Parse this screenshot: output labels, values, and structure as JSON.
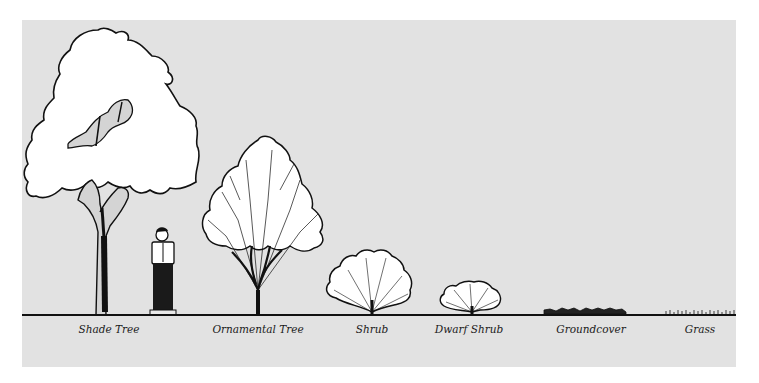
{
  "figure": {
    "background_color": "#e2e2e2",
    "line_color": "#111111",
    "canopy_fill": "#ffffff",
    "labels": [
      {
        "id": "shade-tree",
        "text": "Shade Tree",
        "x": 109
      },
      {
        "id": "ornamental-tree",
        "text": "Ornamental Tree",
        "x": 258
      },
      {
        "id": "shrub",
        "text": "Shrub",
        "x": 372
      },
      {
        "id": "dwarf-shrub",
        "text": "Dwarf Shrub",
        "x": 469
      },
      {
        "id": "groundcover",
        "text": "Groundcover",
        "x": 591
      },
      {
        "id": "grass",
        "text": "Grass",
        "x": 700
      }
    ]
  }
}
